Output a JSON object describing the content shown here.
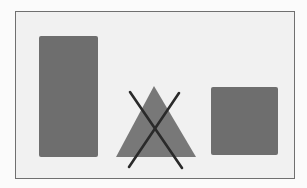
{
  "diagram": {
    "colors": {
      "background": "#f1f1f1",
      "frame_border": "#707070",
      "shape_fill": "#6e6e6e",
      "triangle_fill": "#777777",
      "cross_stroke": "#2a2a2a"
    },
    "shapes": [
      {
        "name": "tall-rectangle",
        "type": "rectangle",
        "crossed_out": false
      },
      {
        "name": "triangle",
        "type": "triangle",
        "crossed_out": true
      },
      {
        "name": "square",
        "type": "square",
        "crossed_out": false
      }
    ]
  }
}
